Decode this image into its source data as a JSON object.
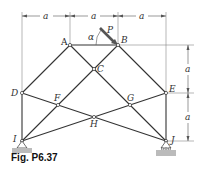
{
  "figure": {
    "caption": "Fig. P6.37",
    "load_label": "P",
    "angle_label": "α",
    "dimension_label": "a"
  },
  "joints": {
    "A": "A",
    "B": "B",
    "C": "C",
    "D": "D",
    "E": "E",
    "F": "F",
    "G": "G",
    "H": "H",
    "I": "I",
    "J": "J"
  },
  "dimensions": {
    "top": [
      "a",
      "a",
      "a"
    ],
    "right": [
      "a",
      "a"
    ]
  },
  "colors": {
    "member": "#333333",
    "dimension": "#555555",
    "ground": "#bbbbbb"
  }
}
